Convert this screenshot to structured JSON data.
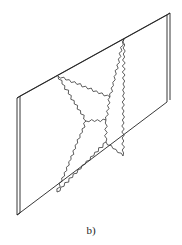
{
  "figure": {
    "caption": "b)",
    "colors": {
      "line": "#222222",
      "crack": "#333333",
      "background": "#ffffff"
    },
    "slab": {
      "front_face": [
        [
          17,
          98
        ],
        [
          167,
          15
        ],
        [
          167,
          102
        ],
        [
          17,
          215
        ]
      ],
      "thickness_offset": [
        3,
        -2
      ]
    },
    "nodes": {
      "A": [
        58,
        76
      ],
      "B": [
        124,
        39
      ],
      "C": [
        57,
        192
      ],
      "D": [
        123,
        156
      ],
      "E": [
        86,
        121
      ],
      "F": [
        106,
        120
      ],
      "G": [
        110,
        97
      ],
      "H": [
        106,
        142
      ]
    },
    "cracks": [
      [
        "A",
        "G"
      ],
      [
        "A",
        "E"
      ],
      [
        "E",
        "F"
      ],
      [
        "B",
        "G"
      ],
      [
        "G",
        "F"
      ],
      [
        "B",
        "D"
      ],
      [
        "F",
        "H"
      ],
      [
        "H",
        "D"
      ],
      [
        "E",
        "C"
      ],
      [
        "H",
        "C"
      ]
    ]
  }
}
